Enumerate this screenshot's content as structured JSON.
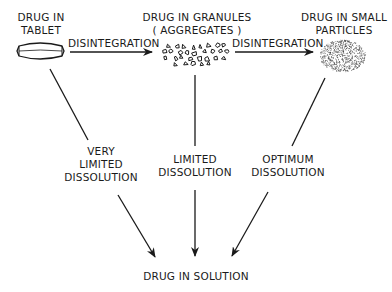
{
  "nodes": {
    "tablet": {
      "line1": "DRUG IN",
      "line2": "TABLET"
    },
    "granules": {
      "line1": "DRUG IN GRANULES",
      "line2": "( AGGREGATES )"
    },
    "particles": {
      "line1": "DRUG IN SMALL",
      "line2": "PARTICLES"
    },
    "solution": {
      "label": "DRUG IN SOLUTION"
    }
  },
  "edges": {
    "disintegration_1": "DISINTEGRATION",
    "disintegration_2": "DISINTEGRATION",
    "very_limited": {
      "line1": "VERY",
      "line2": "LIMITED",
      "line3": "DISSOLUTION"
    },
    "limited": {
      "line1": "LIMITED",
      "line2": "DISSOLUTION"
    },
    "optimum": {
      "line1": "OPTIMUM",
      "line2": "DISSOLUTION"
    }
  }
}
